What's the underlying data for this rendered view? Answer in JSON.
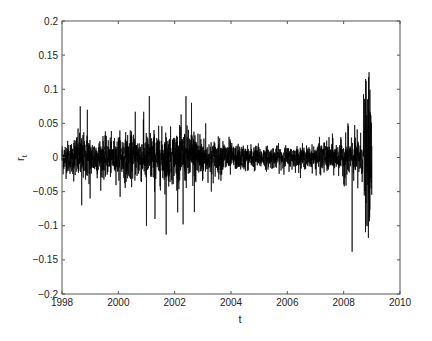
{
  "chart_data": {
    "type": "line",
    "title": "",
    "xlabel": "t",
    "ylabel": "r_t",
    "xlim": [
      1998,
      2010
    ],
    "ylim": [
      -0.2,
      0.2
    ],
    "grid": false,
    "legend": null,
    "x_ticks": [
      "1998",
      "2000",
      "2002",
      "2004",
      "2006",
      "2008",
      "2010"
    ],
    "y_ticks": [
      "-0.2",
      "-0.15",
      "-0.1",
      "-0.05",
      "0",
      "0.05",
      "0.1",
      "0.15",
      "0.2"
    ],
    "series": [
      {
        "name": "r_t",
        "color": "#000000",
        "x_start": 1998.0,
        "x_end": 2009.0,
        "volatility_regimes": [
          {
            "from": 1998.0,
            "to": 1998.4,
            "sigma": 0.012
          },
          {
            "from": 1998.4,
            "to": 1999.0,
            "sigma": 0.017
          },
          {
            "from": 1999.0,
            "to": 2000.0,
            "sigma": 0.014
          },
          {
            "from": 2000.0,
            "to": 2001.0,
            "sigma": 0.017
          },
          {
            "from": 2001.0,
            "to": 2002.0,
            "sigma": 0.019
          },
          {
            "from": 2002.0,
            "to": 2003.0,
            "sigma": 0.02
          },
          {
            "from": 2003.0,
            "to": 2004.0,
            "sigma": 0.013
          },
          {
            "from": 2004.0,
            "to": 2005.0,
            "sigma": 0.009
          },
          {
            "from": 2005.0,
            "to": 2006.0,
            "sigma": 0.008
          },
          {
            "from": 2006.0,
            "to": 2007.0,
            "sigma": 0.008
          },
          {
            "from": 2007.0,
            "to": 2008.0,
            "sigma": 0.011
          },
          {
            "from": 2008.0,
            "to": 2008.7,
            "sigma": 0.016
          },
          {
            "from": 2008.7,
            "to": 2009.0,
            "sigma": 0.045
          }
        ],
        "notable_points": [
          {
            "x": 1998.65,
            "y": 0.075
          },
          {
            "x": 1998.9,
            "y": 0.07
          },
          {
            "x": 1998.7,
            "y": -0.07
          },
          {
            "x": 1999.0,
            "y": -0.06
          },
          {
            "x": 2000.6,
            "y": 0.067
          },
          {
            "x": 2000.9,
            "y": 0.067
          },
          {
            "x": 2001.1,
            "y": 0.09
          },
          {
            "x": 2001.0,
            "y": -0.1
          },
          {
            "x": 2001.3,
            "y": -0.09
          },
          {
            "x": 2001.7,
            "y": 0.118
          },
          {
            "x": 2001.7,
            "y": -0.113
          },
          {
            "x": 2002.3,
            "y": -0.098
          },
          {
            "x": 2002.4,
            "y": 0.09
          },
          {
            "x": 2002.6,
            "y": 0.08
          },
          {
            "x": 2002.7,
            "y": -0.08
          },
          {
            "x": 2003.1,
            "y": 0.05
          },
          {
            "x": 2003.3,
            "y": -0.05
          },
          {
            "x": 2007.6,
            "y": 0.035
          },
          {
            "x": 2008.15,
            "y": 0.05
          },
          {
            "x": 2008.3,
            "y": -0.138
          },
          {
            "x": 2008.5,
            "y": -0.045
          },
          {
            "x": 2008.78,
            "y": 0.115
          },
          {
            "x": 2008.9,
            "y": 0.125
          },
          {
            "x": 2008.8,
            "y": -0.1
          },
          {
            "x": 2008.88,
            "y": -0.118
          }
        ],
        "n_points": 2800
      }
    ]
  },
  "axes": {
    "x_label": "t",
    "y_label": "r",
    "y_label_subscript": "t"
  }
}
